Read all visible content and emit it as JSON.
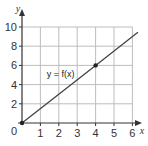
{
  "chart_data": {
    "type": "line",
    "title": "",
    "xlabel": "x",
    "ylabel": "y",
    "xlim": [
      0,
      6
    ],
    "ylim": [
      0,
      10
    ],
    "grid": true,
    "x_ticks": [
      0,
      1,
      2,
      3,
      4,
      5,
      6
    ],
    "y_ticks": [
      2,
      4,
      6,
      8,
      10
    ],
    "origin_label": "0",
    "series": [
      {
        "name": "y = f(x)",
        "x": [
          0,
          4,
          6.3
        ],
        "y": [
          0,
          6,
          9.45
        ],
        "marked_points": [
          {
            "x": 0,
            "y": 0
          },
          {
            "x": 4,
            "y": 6
          }
        ]
      }
    ],
    "annotations": [
      {
        "text": "y = f(x)",
        "x": 2.1,
        "y": 4.8
      }
    ],
    "colors": {
      "grid": "#bdbdbd",
      "axis": "#333333",
      "line": "#444444",
      "point": "#222222"
    }
  }
}
